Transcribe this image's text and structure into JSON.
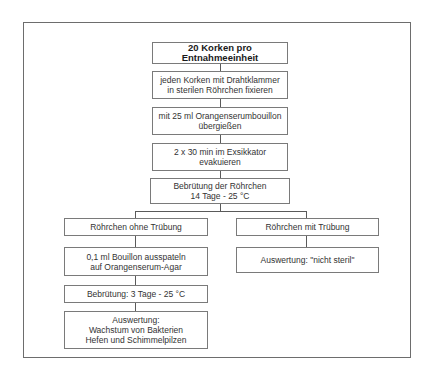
{
  "flowchart": {
    "start": "20 Korken pro Entnahmeeinheit",
    "steps": [
      "jeden Korken mit Drahtklammer\nin sterilen Röhrchen fixieren",
      "mit 25 ml Orangenserumbouillon\nübergießen",
      "2 x 30 min im Exsikkator\nevakuieren",
      "Bebrütung der Röhrchen\n14 Tage - 25 °C"
    ],
    "branch_left": {
      "label": "Röhrchen ohne Trübung",
      "steps": [
        "0,1 ml Bouillon ausspateln\nauf Orangenserum-Agar",
        "Bebrütung: 3 Tage - 25 °C",
        "Auswertung:\nWachstum von Bakterien\nHefen und Schimmelpilzen"
      ]
    },
    "branch_right": {
      "label": "Röhrchen mit Trübung",
      "steps": [
        "Auswertung: \"nicht steril\""
      ]
    }
  }
}
